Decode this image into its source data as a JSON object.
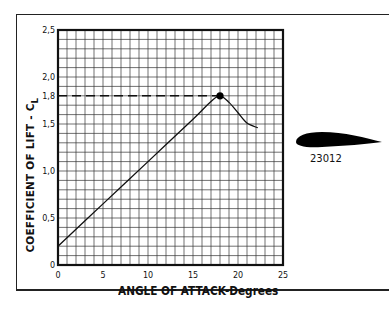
{
  "chart_data": {
    "type": "line",
    "title": "",
    "xlabel": "ANGLE OF ATTACK-Degrees",
    "ylabel": "COEFFICIENT OF LIFT - C",
    "ylabel_subscript": "L",
    "xlim": [
      0,
      25
    ],
    "ylim": [
      0,
      2.5
    ],
    "x_ticks": [
      "0",
      "5",
      "10",
      "15",
      "20",
      "25"
    ],
    "y_ticks": [
      "0",
      "0,5",
      "1,0",
      "1,5",
      "1,8",
      "2,0",
      "2,5"
    ],
    "grid": true,
    "grid_minor_x": 1,
    "grid_minor_y": 0.1,
    "series": [
      {
        "name": "23012",
        "x": [
          0,
          5,
          10,
          15,
          17,
          18,
          19,
          20,
          21,
          22.2
        ],
        "y": [
          0.2,
          0.65,
          1.1,
          1.55,
          1.74,
          1.8,
          1.73,
          1.62,
          1.51,
          1.46
        ]
      }
    ],
    "annotations": [
      {
        "type": "point",
        "x": 18,
        "y": 1.8,
        "label": "CL max"
      },
      {
        "type": "dashed-hline",
        "y": 1.8,
        "from_x": 0,
        "to_x": 18
      }
    ],
    "airfoil_label": "23012"
  }
}
